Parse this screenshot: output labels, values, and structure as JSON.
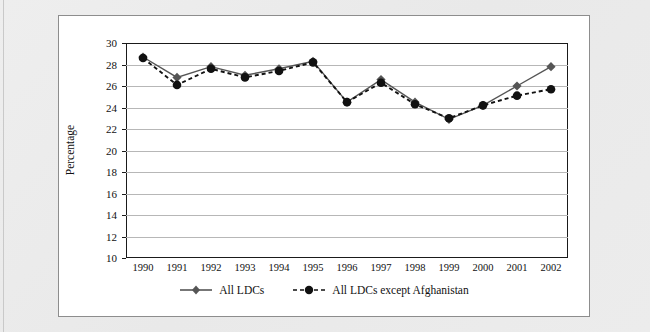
{
  "chart_data": {
    "type": "line",
    "title": "",
    "xlabel": "",
    "ylabel": "Percentage",
    "categories": [
      "1990",
      "1991",
      "1992",
      "1993",
      "1994",
      "1995",
      "1996",
      "1997",
      "1998",
      "1999",
      "2000",
      "2001",
      "2002"
    ],
    "ylim": [
      10,
      30
    ],
    "ytick_step": 2,
    "yticks": [
      10,
      12,
      14,
      16,
      18,
      20,
      22,
      24,
      26,
      28,
      30
    ],
    "grid": true,
    "legend_position": "bottom-center",
    "series": [
      {
        "name": "All LDCs",
        "style": "solid",
        "marker": "diamond",
        "color": "#555555",
        "values": [
          28.7,
          26.8,
          27.8,
          27.0,
          27.6,
          28.3,
          24.5,
          26.6,
          24.5,
          22.9,
          24.2,
          26.0,
          27.8
        ]
      },
      {
        "name": "All LDCs except Afghanistan",
        "style": "dashed",
        "marker": "circle",
        "color": "#111111",
        "values": [
          28.6,
          26.1,
          27.6,
          26.8,
          27.4,
          28.2,
          24.5,
          26.3,
          24.3,
          23.0,
          24.2,
          25.1,
          25.7
        ]
      }
    ]
  },
  "axis": {
    "y_title": "Percentage",
    "y_tick_labels": [
      "30",
      "28",
      "26",
      "24",
      "22",
      "20",
      "18",
      "16",
      "14",
      "12",
      "10"
    ],
    "x_tick_labels": [
      "1990",
      "1991",
      "1992",
      "1993",
      "1994",
      "1995",
      "1996",
      "1997",
      "1998",
      "1999",
      "2000",
      "2001",
      "2002"
    ]
  },
  "legend": {
    "entries": [
      {
        "label": "All LDCs",
        "marker": "diamond-marker",
        "line": "solid-line"
      },
      {
        "label": "All LDCs except Afghanistan",
        "marker": "circle-marker",
        "line": "dashed-line"
      }
    ]
  },
  "colors": {
    "series_1": "#555555",
    "series_2": "#111111",
    "gridline": "#b7b7b7",
    "frame": "#1a1a1a",
    "panel_background": "#ffffff",
    "page_background": "#ebebeb"
  }
}
